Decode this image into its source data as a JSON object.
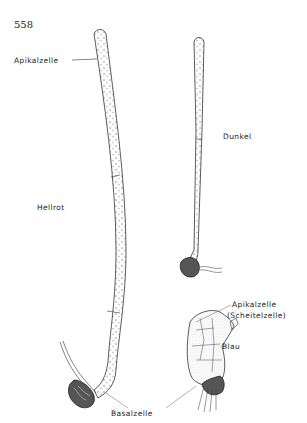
{
  "page_number": "558",
  "labels": {
    "apikalzelle_top": "Apikalzelle",
    "dunkel": "Dunkel",
    "hellrot": "Hellrot",
    "apikalzelle_blau": "Apikalzelle",
    "scheitelzelle": "(Scheitelzelle)",
    "blau": "Blau",
    "basalzelle": "Basalzelle"
  },
  "colors": {
    "ink": "#222222",
    "background": "#ffffff"
  }
}
